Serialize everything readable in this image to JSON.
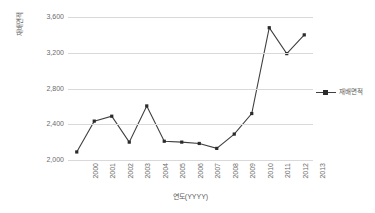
{
  "chart_data": {
    "type": "line",
    "title": "",
    "xlabel": "연도(YYYY)",
    "ylabel": "재배면적",
    "categories": [
      "2000",
      "2001",
      "2002",
      "2003",
      "2004",
      "2005",
      "2006",
      "2007",
      "2008",
      "2009",
      "2010",
      "2011",
      "2012",
      "2013"
    ],
    "series": [
      {
        "name": "재배면적",
        "values": [
          2090,
          2435,
          2490,
          2200,
          2605,
          2210,
          2200,
          2185,
          2130,
          2290,
          2520,
          3480,
          3190,
          3400
        ]
      }
    ],
    "ylim": [
      2000,
      3600
    ],
    "yticks": [
      2000,
      2400,
      2800,
      3200,
      3600
    ],
    "ytick_labels": [
      "2,000",
      "2,400",
      "2,800",
      "3,200",
      "3,600"
    ],
    "grid": true,
    "legend_position": "right",
    "marker": "square",
    "colors": {
      "series_line": "#404040",
      "series_marker": "#2b2b2b",
      "gridline": "#d9d9d9",
      "text": "#5a5a5a",
      "background": "#ffffff"
    }
  },
  "legend": {
    "entries": [
      {
        "label": "재배면적"
      }
    ]
  }
}
